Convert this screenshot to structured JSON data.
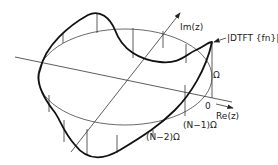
{
  "diagram": {
    "axes": {
      "real_label": "Re(z)",
      "imag_label": "Im(z)"
    },
    "curve_label": "|DTFT {fn}|",
    "frequency_labels": {
      "zero": "0",
      "omega": "Ω",
      "n_minus_1": "(N−1)Ω",
      "n_minus_2": "(N−2)Ω"
    },
    "colors": {
      "stroke": "#222222",
      "background": "#ffffff"
    }
  }
}
